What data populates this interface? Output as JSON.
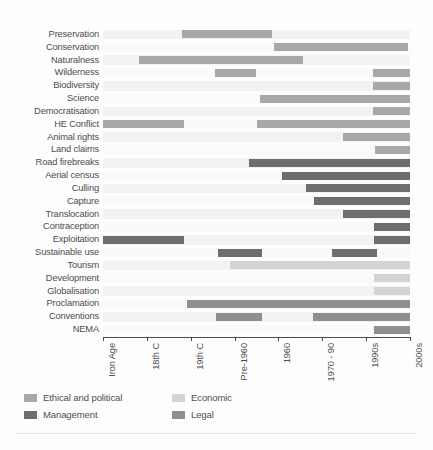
{
  "chart_data": {
    "type": "bar",
    "orientation": "horizontal-gantt",
    "title": "",
    "subtitle": "",
    "xlabel": "",
    "ylabel": "",
    "grid": false,
    "legend_position": "bottom-left",
    "x_tick_labels": [
      "Iron Age",
      "18th C",
      "19th C",
      "Pre-1960",
      "1960",
      "1970 - 90",
      "1990s",
      "2000s"
    ],
    "x_tick_index": [
      0,
      1,
      2,
      3,
      4,
      5,
      6,
      7
    ],
    "categories": [
      "Preservation",
      "Conservation",
      "Naturalness",
      "Wilderness",
      "Biodiversity",
      "Science",
      "Democratisation",
      "HE Conflict",
      "Animal rights",
      "Land claims",
      "Road firebreaks",
      "Aerial census",
      "Culling",
      "Capture",
      "Translocation",
      "Contraception",
      "Exploitation",
      "Sustainable use",
      "Tourism",
      "Development",
      "Globalisation",
      "Proclamation",
      "Conventions",
      "NEMA"
    ],
    "series": [
      {
        "name": "Ethical and political",
        "color": "#a8a8a8"
      },
      {
        "name": "Economic",
        "color": "#d4d4d4"
      },
      {
        "name": "Management",
        "color": "#6e6e6e"
      },
      {
        "name": "Legal",
        "color": "#8f8f8f"
      }
    ],
    "bars": [
      {
        "category": "Preservation",
        "row": 0,
        "start": 1.8,
        "end": 3.85,
        "series": "Ethical and political",
        "color": "#a8a8a8"
      },
      {
        "category": "Conservation",
        "row": 1,
        "start": 3.9,
        "end": 6.95,
        "series": "Ethical and political",
        "color": "#a8a8a8"
      },
      {
        "category": "Naturalness",
        "row": 2,
        "start": 0.82,
        "end": 4.55,
        "series": "Ethical and political",
        "color": "#a8a8a8"
      },
      {
        "category": "Wilderness",
        "row": 3,
        "start": 2.55,
        "end": 3.5,
        "series": "Ethical and political",
        "color": "#a8a8a8"
      },
      {
        "category": "Wilderness",
        "row": 3,
        "start": 6.15,
        "end": 7.2,
        "series": "Ethical and political",
        "color": "#a8a8a8"
      },
      {
        "category": "Biodiversity",
        "row": 4,
        "start": 6.15,
        "end": 7.2,
        "series": "Ethical and political",
        "color": "#a8a8a8"
      },
      {
        "category": "Science",
        "row": 5,
        "start": 3.58,
        "end": 7.2,
        "series": "Ethical and political",
        "color": "#a8a8a8"
      },
      {
        "category": "Democratisation",
        "row": 6,
        "start": 6.15,
        "end": 7.2,
        "series": "Ethical and political",
        "color": "#a8a8a8"
      },
      {
        "category": "HE Conflict",
        "row": 7,
        "start": -0.2,
        "end": 1.85,
        "series": "Ethical and political",
        "color": "#a8a8a8"
      },
      {
        "category": "HE Conflict",
        "row": 7,
        "start": 3.52,
        "end": 7.2,
        "series": "Ethical and political",
        "color": "#a8a8a8"
      },
      {
        "category": "Animal rights",
        "row": 8,
        "start": 5.48,
        "end": 7.2,
        "series": "Ethical and political",
        "color": "#a8a8a8"
      },
      {
        "category": "Land claims",
        "row": 9,
        "start": 6.2,
        "end": 7.2,
        "series": "Ethical and political",
        "color": "#a8a8a8"
      },
      {
        "category": "Road firebreaks",
        "row": 10,
        "start": 3.32,
        "end": 7.2,
        "series": "Management",
        "color": "#6e6e6e"
      },
      {
        "category": "Aerial census",
        "row": 11,
        "start": 4.08,
        "end": 7.2,
        "series": "Management",
        "color": "#6e6e6e"
      },
      {
        "category": "Culling",
        "row": 12,
        "start": 4.62,
        "end": 7.2,
        "series": "Management",
        "color": "#6e6e6e"
      },
      {
        "category": "Capture",
        "row": 13,
        "start": 4.82,
        "end": 7.2,
        "series": "Management",
        "color": "#6e6e6e"
      },
      {
        "category": "Translocation",
        "row": 14,
        "start": 5.48,
        "end": 7.2,
        "series": "Management",
        "color": "#6e6e6e"
      },
      {
        "category": "Contraception",
        "row": 15,
        "start": 6.18,
        "end": 7.2,
        "series": "Management",
        "color": "#6e6e6e"
      },
      {
        "category": "Exploitation",
        "row": 16,
        "start": -0.2,
        "end": 1.85,
        "series": "Management",
        "color": "#6e6e6e"
      },
      {
        "category": "Exploitation",
        "row": 16,
        "start": 6.18,
        "end": 7.2,
        "series": "Management",
        "color": "#6e6e6e"
      },
      {
        "category": "Sustainable use",
        "row": 17,
        "start": 2.62,
        "end": 3.62,
        "series": "Management",
        "color": "#6e6e6e"
      },
      {
        "category": "Sustainable use",
        "row": 17,
        "start": 5.22,
        "end": 6.25,
        "series": "Management",
        "color": "#6e6e6e"
      },
      {
        "category": "Tourism",
        "row": 18,
        "start": 2.9,
        "end": 7.2,
        "series": "Economic",
        "color": "#d4d4d4"
      },
      {
        "category": "Development",
        "row": 19,
        "start": 6.18,
        "end": 7.2,
        "series": "Economic",
        "color": "#d4d4d4"
      },
      {
        "category": "Globalisation",
        "row": 20,
        "start": 6.18,
        "end": 7.2,
        "series": "Economic",
        "color": "#d4d4d4"
      },
      {
        "category": "Proclamation",
        "row": 21,
        "start": 1.92,
        "end": 7.2,
        "series": "Legal",
        "color": "#8f8f8f"
      },
      {
        "category": "Conventions",
        "row": 22,
        "start": 2.58,
        "end": 3.62,
        "series": "Legal",
        "color": "#8f8f8f"
      },
      {
        "category": "Conventions",
        "row": 22,
        "start": 4.78,
        "end": 7.2,
        "series": "Legal",
        "color": "#8f8f8f"
      },
      {
        "category": "NEMA",
        "row": 23,
        "start": 6.18,
        "end": 7.2,
        "series": "Legal",
        "color": "#8f8f8f"
      }
    ]
  },
  "legend": {
    "items": [
      {
        "label": "Ethical and political",
        "color": "#a8a8a8"
      },
      {
        "label": "Economic",
        "color": "#d4d4d4"
      },
      {
        "label": "Management",
        "color": "#6e6e6e"
      },
      {
        "label": "Legal",
        "color": "#8f8f8f"
      }
    ]
  },
  "colors": {
    "ethical_political": "#a8a8a8",
    "economic": "#d4d4d4",
    "management": "#6e6e6e",
    "legal": "#8f8f8f",
    "axis": "#4a4a4a",
    "text": "#4d4d4d",
    "stripe": "#f2f2f2",
    "background": "#fdfdfd"
  }
}
